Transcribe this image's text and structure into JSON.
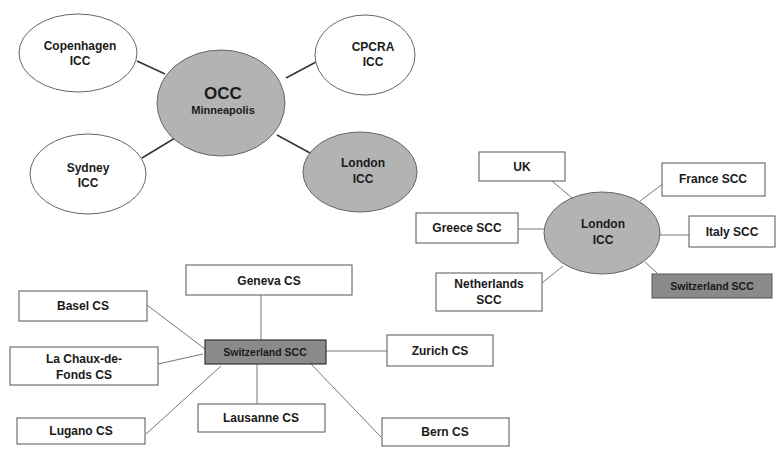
{
  "colors": {
    "background": "#ffffff",
    "ellipse_gray": "#b3b3b3",
    "box_dark_gray": "#8a8a8a",
    "white_fill": "#ffffff",
    "stroke": "#555555",
    "line": "#444444",
    "text": "#1a1a1a"
  },
  "diagram_1": {
    "center": {
      "line1": "OCC",
      "line2": "Minneapolis"
    },
    "nodes": [
      {
        "id": "copenhagen",
        "line1": "Copenhagen",
        "line2": "ICC",
        "fill": "white"
      },
      {
        "id": "cpcra",
        "line1": "CPCRA",
        "line2": "ICC",
        "fill": "white"
      },
      {
        "id": "sydney",
        "line1": "Sydney",
        "line2": "ICC",
        "fill": "white"
      },
      {
        "id": "london",
        "line1": "London",
        "line2": "ICC",
        "fill": "gray"
      }
    ]
  },
  "diagram_2": {
    "center": {
      "line1": "London",
      "line2": "ICC"
    },
    "nodes": [
      {
        "id": "uk",
        "line1": "UK"
      },
      {
        "id": "france",
        "line1": "France SCC"
      },
      {
        "id": "greece",
        "line1": "Greece SCC"
      },
      {
        "id": "italy",
        "line1": "Italy SCC"
      },
      {
        "id": "netherlands",
        "line1": "Netherlands",
        "line2": "SCC"
      },
      {
        "id": "switzerland",
        "line1": "Switzerland SCC",
        "fill": "dark"
      }
    ]
  },
  "diagram_3": {
    "center": {
      "line1": "Switzerland SCC"
    },
    "nodes": [
      {
        "id": "geneva",
        "line1": "Geneva CS"
      },
      {
        "id": "basel",
        "line1": "Basel CS"
      },
      {
        "id": "la-chaux",
        "line1": "La Chaux-de-",
        "line2": "Fonds CS"
      },
      {
        "id": "zurich",
        "line1": "Zurich CS"
      },
      {
        "id": "lugano",
        "line1": "Lugano CS"
      },
      {
        "id": "lausanne",
        "line1": "Lausanne CS"
      },
      {
        "id": "bern",
        "line1": "Bern CS"
      }
    ]
  }
}
